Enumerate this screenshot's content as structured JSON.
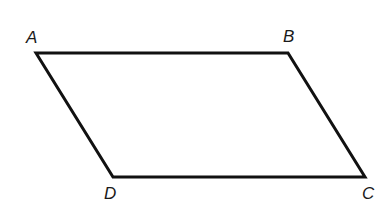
{
  "diagram": {
    "type": "parallelogram",
    "stroke_color": "#111111",
    "vertices": [
      {
        "label": "A",
        "x": 36,
        "y": 53
      },
      {
        "label": "B",
        "x": 288,
        "y": 53
      },
      {
        "label": "C",
        "x": 365,
        "y": 177
      },
      {
        "label": "D",
        "x": 113,
        "y": 177
      }
    ],
    "labels": {
      "A": "A",
      "B": "B",
      "C": "C",
      "D": "D"
    }
  }
}
